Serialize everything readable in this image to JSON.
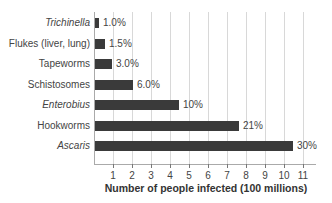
{
  "chart_data": {
    "type": "bar",
    "orientation": "horizontal",
    "title": "",
    "xlabel": "Number of people infected (100 millions)",
    "ylabel": "",
    "xlim": [
      0,
      11.5
    ],
    "xticks": [
      "1",
      "2",
      "3",
      "4",
      "5",
      "6",
      "7",
      "8",
      "9",
      "10",
      "11"
    ],
    "grid": true,
    "categories": [
      "Trichinella",
      "Flukes (liver, lung)",
      "Tapeworms",
      "Schistosomes",
      "Enterobius",
      "Hookworms",
      "Ascaris"
    ],
    "italic_categories": [
      "Trichinella",
      "Enterobius",
      "Ascaris"
    ],
    "values": [
      0.2,
      0.5,
      0.9,
      2.0,
      4.4,
      7.6,
      10.4
    ],
    "annotations": [
      "1.0%",
      "1.5%",
      "3.0%",
      "6.0%",
      "10%",
      "21%",
      "30%"
    ],
    "bar_color": "#3a3a3a"
  }
}
